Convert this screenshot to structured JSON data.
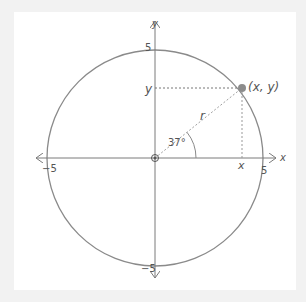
{
  "diagram": {
    "type": "unit-circle",
    "radius_value": 5,
    "angle_degrees": 37,
    "axes": {
      "x_label": "x",
      "y_label": "y",
      "ticks": {
        "x_pos": "5",
        "x_neg": "−5",
        "y_pos": "5",
        "y_neg": "−5"
      }
    },
    "point_label": "(x, y)",
    "radius_label": "r",
    "angle_label": "37°",
    "projection_labels": {
      "x": "x",
      "y": "y"
    },
    "colors": {
      "background": "#f2f2f2",
      "panel": "#ffffff",
      "circle": "#8a8a8a",
      "axis": "#7a7a7a",
      "dashed": "#9a9a9a",
      "point": "#8c8c8c",
      "text": "#555555"
    }
  }
}
